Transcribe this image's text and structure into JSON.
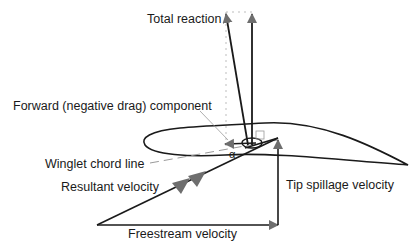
{
  "labels": {
    "total_reaction": "Total reaction",
    "forward_component": "Forward (negative drag) component",
    "winglet_chord_line": "Winglet chord line",
    "resultant_velocity": "Resultant velocity",
    "tip_spillage_velocity": "Tip spillage velocity",
    "freestream_velocity": "Freestream velocity",
    "angle_symbol": "α"
  },
  "colors": {
    "line": "#1a1a1a",
    "arrowhead": "#6e6e6e",
    "dashed": "#9a9a9a",
    "background": "#ffffff"
  }
}
